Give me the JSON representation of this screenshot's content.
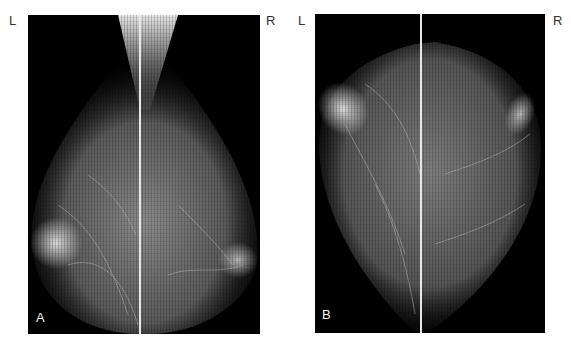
{
  "figure": {
    "type": "two-panel mammography figure",
    "note": "Tissue shapes are stylized decorative approximations; original radiographic detail is not reproduced.",
    "panels": [
      {
        "id": "A",
        "letter": "A",
        "left_label": "L",
        "right_label": "R",
        "view_description": "oblique-style view with pectoral wedge at top center",
        "background_color": "#000000",
        "divider_color": "#e6e6e6"
      },
      {
        "id": "B",
        "letter": "B",
        "left_label": "L",
        "right_label": "R",
        "view_description": "craniocaudal-style view",
        "background_color": "#000000",
        "divider_color": "#e6e6e6"
      }
    ]
  }
}
